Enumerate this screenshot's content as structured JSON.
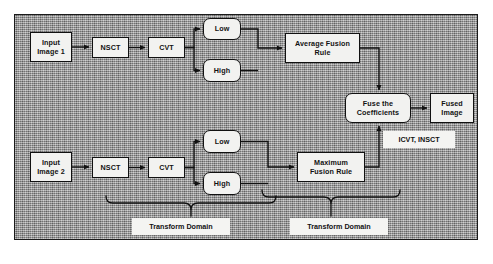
{
  "figure": {
    "frame": {
      "x": 14,
      "y": 14,
      "w": 464,
      "h": 226
    },
    "background_color": "#9c9c9c",
    "node_fill": "#f2f2f0",
    "line_color": "#111111"
  },
  "nodes": [
    {
      "id": "input1",
      "label": "Input\nImage 1",
      "x": 30,
      "y": 32,
      "w": 42,
      "h": 30,
      "shape": "rect"
    },
    {
      "id": "nsct1",
      "label": "NSCT",
      "x": 92,
      "y": 37,
      "w": 37,
      "h": 21,
      "shape": "rect"
    },
    {
      "id": "cvt1",
      "label": "CVT",
      "x": 148,
      "y": 37,
      "w": 37,
      "h": 21,
      "shape": "rect"
    },
    {
      "id": "low1",
      "label": "Low",
      "x": 203,
      "y": 18,
      "w": 38,
      "h": 22,
      "shape": "rounded"
    },
    {
      "id": "high1",
      "label": "High",
      "x": 203,
      "y": 59,
      "w": 38,
      "h": 23,
      "shape": "rounded"
    },
    {
      "id": "avgrule",
      "label": "Average Fusion\nRule",
      "x": 285,
      "y": 33,
      "w": 75,
      "h": 30,
      "shape": "rect"
    },
    {
      "id": "fuse",
      "label": "Fuse the\nCoefficients",
      "x": 345,
      "y": 93,
      "w": 66,
      "h": 30,
      "shape": "rounded"
    },
    {
      "id": "fused",
      "label": "Fused\nImage",
      "x": 430,
      "y": 93,
      "w": 44,
      "h": 30,
      "shape": "rect"
    },
    {
      "id": "low2",
      "label": "Low",
      "x": 203,
      "y": 130,
      "w": 38,
      "h": 23,
      "shape": "rounded"
    },
    {
      "id": "high2",
      "label": "High",
      "x": 203,
      "y": 172,
      "w": 38,
      "h": 23,
      "shape": "rounded"
    },
    {
      "id": "input2",
      "label": "Input\nImage 2",
      "x": 30,
      "y": 152,
      "w": 42,
      "h": 30,
      "shape": "rect"
    },
    {
      "id": "nsct2",
      "label": "NSCT",
      "x": 92,
      "y": 157,
      "w": 37,
      "h": 21,
      "shape": "rect"
    },
    {
      "id": "cvt2",
      "label": "CVT",
      "x": 148,
      "y": 157,
      "w": 37,
      "h": 21,
      "shape": "rect"
    },
    {
      "id": "maxrule",
      "label": "Maximum\nFusion Rule",
      "x": 297,
      "y": 152,
      "w": 68,
      "h": 30,
      "shape": "rect"
    }
  ],
  "annotations": [
    {
      "id": "icvt",
      "label": "ICVT, INSCT",
      "x": 383,
      "y": 131,
      "w": 72,
      "h": 17
    },
    {
      "id": "td1",
      "label": "Transform Domain",
      "x": 132,
      "y": 218,
      "w": 98,
      "h": 17
    },
    {
      "id": "td2",
      "label": "Transform Domain",
      "x": 290,
      "y": 218,
      "w": 98,
      "h": 17
    }
  ],
  "braces": [
    {
      "id": "brace-left",
      "left": 106,
      "right": 276,
      "top": 196,
      "tip_y": 216,
      "mid": 191
    },
    {
      "id": "brace-right",
      "left": 262,
      "right": 400,
      "top": 190,
      "tip_y": 216,
      "mid": 331
    }
  ]
}
